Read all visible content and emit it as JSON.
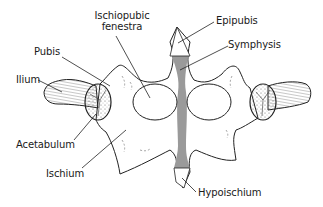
{
  "diagram": {
    "colors": {
      "outline": "#222222",
      "bone_fill": "#ffffff",
      "symphysis_fill": "#9a9a9a",
      "background": "#ffffff"
    },
    "labels": {
      "ischiopubic_fenestra_line1": "Ischiopubic",
      "ischiopubic_fenestra_line2": "fenestra",
      "epipubis": "Epipubis",
      "symphysis": "Symphysis",
      "pubis": "Pubis",
      "ilium": "Ilium",
      "acetabulum": "Acetabulum",
      "ischium": "Ischium",
      "hypoischium": "Hypoischium"
    }
  }
}
